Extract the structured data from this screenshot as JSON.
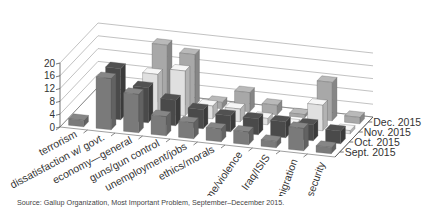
{
  "chart_data": {
    "type": "bar",
    "style": "3d-grouped-depth",
    "title": "",
    "xlabel": "",
    "ylabel": "",
    "ylim": [
      0,
      20
    ],
    "yticks": [
      "0",
      "4",
      "8",
      "12",
      "16",
      "20"
    ],
    "grid": true,
    "legend_position": "right-depth-axis",
    "categories": [
      "terrorism",
      "dissatisfaction w/ govt.",
      "economy—general",
      "guns/gun control",
      "unemployment/jobs",
      "ethics/morals",
      "crime/violence",
      "Iraq/ISIS",
      "immigration",
      "national security"
    ],
    "series": [
      {
        "name": "Sept. 2015",
        "color": "#7a7a7a",
        "values": [
          2,
          16,
          12,
          6,
          5,
          4,
          4,
          2,
          7,
          2
        ]
      },
      {
        "name": "Oct. 2015",
        "color": "#4a4a4a",
        "values": [
          0,
          16,
          11,
          8,
          6,
          5,
          5,
          5,
          5,
          4
        ]
      },
      {
        "name": "Nov. 2015",
        "color": "#e0e0e0",
        "values": [
          0,
          3,
          12,
          14,
          4,
          4,
          2,
          1,
          8,
          1
        ]
      },
      {
        "name": "Dec. 2015",
        "color": "#a8a8a8",
        "values": [
          0,
          0,
          18,
          16,
          2,
          6,
          3,
          1,
          12,
          2
        ]
      }
    ]
  },
  "source": "Source: Gallup Organization, Most Important Problem, September–December 2015."
}
